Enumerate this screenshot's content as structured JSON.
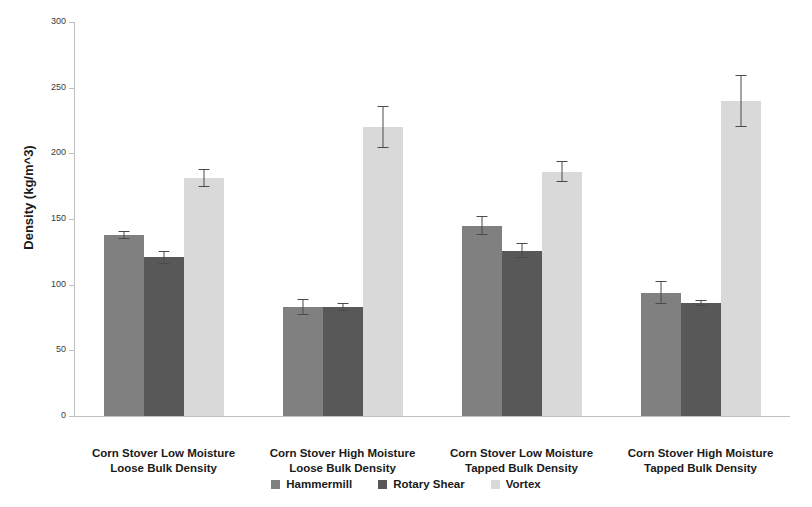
{
  "chart_data": {
    "type": "bar",
    "title": "",
    "xlabel": "",
    "ylabel": "Density (kg/m^3)",
    "ylim": [
      0,
      300
    ],
    "ytick_step": 50,
    "yticks": [
      "300",
      "250",
      "200",
      "150",
      "100",
      "50",
      "0"
    ],
    "grid": false,
    "legend_position": "bottom",
    "categories": [
      "Corn Stover Low Moisture Loose Bulk Density",
      "Corn Stover High Moisture Loose Bulk Density",
      "Corn Stover Low Moisture Tapped Bulk Density",
      "Corn Stover High Moisture Tapped Bulk Density"
    ],
    "category_lines": [
      [
        "Corn Stover Low Moisture",
        "Loose Bulk Density"
      ],
      [
        "Corn Stover High Moisture",
        "Loose Bulk Density"
      ],
      [
        "Corn Stover Low Moisture",
        "Tapped Bulk Density"
      ],
      [
        "Corn Stover High Moisture",
        "Tapped Bulk Density"
      ]
    ],
    "series": [
      {
        "name": "Hammermill",
        "color": "#808080",
        "values": [
          138,
          83,
          145,
          94
        ],
        "errors": [
          3,
          6,
          7,
          9
        ]
      },
      {
        "name": "Rotary Shear",
        "color": "#585858",
        "values": [
          121,
          83,
          126,
          86
        ],
        "errors": [
          5,
          3,
          6,
          2
        ]
      },
      {
        "name": "Vortex",
        "color": "#d9d9d9",
        "values": [
          181,
          220,
          186,
          240
        ],
        "errors": [
          7,
          16,
          8,
          20
        ]
      }
    ]
  },
  "legend": {
    "items": [
      {
        "label": "Hammermill",
        "color": "#808080"
      },
      {
        "label": "Rotary Shear",
        "color": "#585858"
      },
      {
        "label": "Vortex",
        "color": "#d9d9d9"
      }
    ]
  },
  "axis": {
    "y_title": "Density (kg/m^3)"
  }
}
